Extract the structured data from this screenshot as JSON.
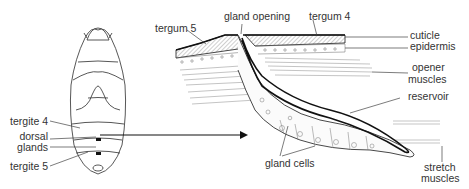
{
  "figure": {
    "left_panel": {
      "subject": "insect abdomen dorsal view",
      "labels": {
        "tergite4": "tergite 4",
        "dorsal": "dorsal",
        "glands": "glands",
        "tergite5": "tergite 5"
      }
    },
    "right_panel": {
      "subject": "dorsal gland cross-section",
      "labels": {
        "tergum5": "tergum 5",
        "gland_opening": "gland opening",
        "tergum4": "tergum 4",
        "cuticle": "cuticle",
        "epidermis": "epidermis",
        "opener": "opener",
        "muscles": "muscles",
        "reservoir": "reservoir",
        "gland_cells": "gland cells",
        "stretch": "stretch",
        "stretch_muscles": "muscles"
      }
    },
    "colors": {
      "line": "#333333",
      "hatch": "#888888"
    }
  }
}
